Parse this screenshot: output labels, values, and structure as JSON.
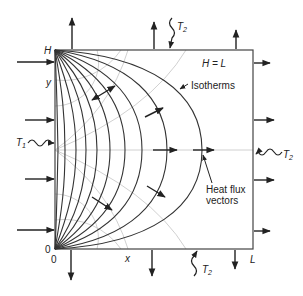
{
  "diagram": {
    "type": "two-dimensional steady conduction in a square plate",
    "labels": {
      "top_left_corner": "H",
      "y_axis": "y",
      "origin_left": "0",
      "origin_bottom": "0",
      "x_axis": "x",
      "bottom_right_corner": "L",
      "aspect": "H = L",
      "isotherms": "Isotherms",
      "heat_flux_line1": "Heat flux",
      "heat_flux_line2": "vectors",
      "left_temperature": "T",
      "left_temperature_sub": "1",
      "top_temperature": "T",
      "top_temperature_sub": "2",
      "right_temperature": "T",
      "right_temperature_sub": "2",
      "bottom_temperature": "T",
      "bottom_temperature_sub": "2"
    },
    "colors": {
      "lines": "#333333",
      "adiabats": "#bbbbbb",
      "background": "#ffffff"
    },
    "isotherm_count": 10,
    "isotherm_midline_x": [
      58,
      65,
      76,
      86,
      97,
      110,
      125,
      142,
      167,
      202
    ]
  }
}
